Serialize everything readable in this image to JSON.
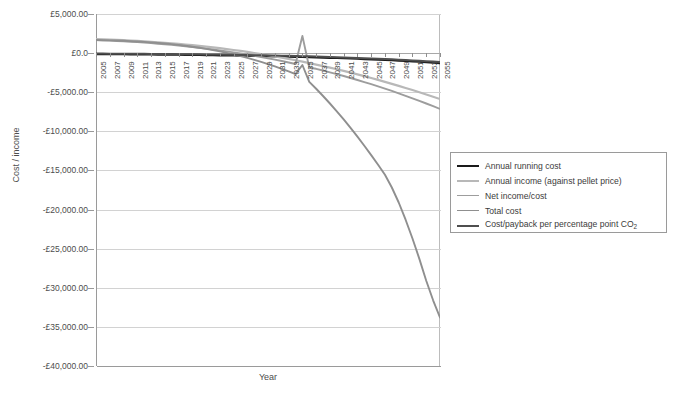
{
  "chart_data": {
    "type": "line",
    "title": "",
    "xlabel": "Year",
    "ylabel": "Cost / income",
    "ylim": [
      -40000,
      5000
    ],
    "ytick_step": 5000,
    "currency_symbol": "£",
    "grid": true,
    "legend_position": "right",
    "ytick_labels": [
      "£5,000.00",
      "£0.0",
      "-£5,000.00",
      "-£10,000.00",
      "-£15,000.00",
      "-£20,000.00",
      "-£25,000.00",
      "-£30,000.00",
      "-£35,000.00",
      "-£40,000.00"
    ],
    "ytick_values": [
      5000,
      0,
      -5000,
      -10000,
      -15000,
      -20000,
      -25000,
      -30000,
      -35000,
      -40000
    ],
    "x": [
      2005,
      2006,
      2007,
      2008,
      2009,
      2010,
      2011,
      2012,
      2013,
      2014,
      2015,
      2016,
      2017,
      2018,
      2019,
      2020,
      2021,
      2022,
      2023,
      2024,
      2025,
      2026,
      2027,
      2028,
      2029,
      2030,
      2031,
      2032,
      2033,
      2034,
      2035,
      2036,
      2037,
      2038,
      2039,
      2040,
      2041,
      2042,
      2043,
      2044,
      2045,
      2046,
      2047,
      2048,
      2049,
      2050,
      2051,
      2052,
      2053,
      2054,
      2055
    ],
    "xtick_labels": [
      "2005",
      "2007",
      "2009",
      "2011",
      "2013",
      "2015",
      "2017",
      "2019",
      "2021",
      "2023",
      "2025",
      "2027",
      "2029",
      "2031",
      "2033",
      "2035",
      "2037",
      "2039",
      "2041",
      "2043",
      "2045",
      "2047",
      "2049",
      "2051",
      "2053",
      "2055"
    ],
    "xlim": [
      2005,
      2055
    ],
    "series": [
      {
        "name": "Annual running cost",
        "color": "#1a1a1a",
        "width": 2.2,
        "values": [
          -120,
          -126,
          -132,
          -138,
          -145,
          -152,
          -159,
          -167,
          -175,
          -183,
          -192,
          -201,
          -211,
          -221,
          -232,
          -243,
          -255,
          -267,
          -280,
          -294,
          -308,
          -323,
          -339,
          -355,
          -372,
          -390,
          -409,
          -429,
          -450,
          -472,
          -495,
          -519,
          -544,
          -570,
          -598,
          -627,
          -657,
          -689,
          -722,
          -757,
          -794,
          -832,
          -872,
          -914,
          -958,
          -1004,
          -1052,
          -1103,
          -1156,
          -1211,
          -1269
        ]
      },
      {
        "name": "Annual income (against pellet price)",
        "color": "#b8b8b8",
        "width": 2.2,
        "values": [
          1790,
          1760,
          1726,
          1690,
          1650,
          1606,
          1558,
          1506,
          1450,
          1389,
          1324,
          1254,
          1180,
          1100,
          1016,
          926,
          832,
          732,
          626,
          515,
          398,
          276,
          148,
          14,
          -126,
          -272,
          -424,
          -582,
          -746,
          -916,
          -1092,
          -1274,
          -1462,
          -1656,
          -1856,
          -2062,
          -2274,
          -2492,
          -2716,
          -2946,
          -3182,
          -3424,
          -3672,
          -3926,
          -4186,
          -4452,
          -4724,
          -5002,
          -5286,
          -5576,
          -5872
        ]
      },
      {
        "name": "Net income/cost",
        "color": "#9d9d9d",
        "width": 1.9,
        "values": [
          1670,
          1634,
          1594,
          1552,
          1505,
          1454,
          1399,
          1339,
          1275,
          1206,
          1132,
          1053,
          969,
          879,
          784,
          683,
          577,
          465,
          346,
          221,
          90,
          -47,
          -191,
          -341,
          -498,
          -662,
          -833,
          -1011,
          -1196,
          -1388,
          2200,
          -1870,
          -2006,
          -2226,
          -2454,
          -2689,
          -2931,
          -3181,
          -3438,
          -3703,
          -3976,
          -4256,
          -4544,
          -4840,
          -5144,
          -5456,
          -5776,
          -6105,
          -6442,
          -6787,
          -7141
        ]
      },
      {
        "name": "Total cost",
        "color": "#8f8f8f",
        "width": 1.9,
        "values": [
          1670,
          1652,
          1630,
          1604,
          1572,
          1534,
          1490,
          1438,
          1378,
          1310,
          1232,
          1144,
          1046,
          938,
          818,
          686,
          542,
          386,
          216,
          32,
          -166,
          -380,
          -610,
          -856,
          -1118,
          -1398,
          -1694,
          -2008,
          -2340,
          -2690,
          -1520,
          -3680,
          -4560,
          -5480,
          -6440,
          -7440,
          -8480,
          -9560,
          -10680,
          -11840,
          -13040,
          -14280,
          -15560,
          -17180,
          -19100,
          -21300,
          -23700,
          -26300,
          -29100,
          -31600,
          -33800
        ]
      },
      {
        "name": "Cost/payback per percentage point CO₂",
        "color": "#4f4f4f",
        "width": 2.0,
        "values": [
          -60,
          -64,
          -68,
          -73,
          -78,
          -83,
          -89,
          -95,
          -101,
          -108,
          -115,
          -123,
          -131,
          -140,
          -149,
          -159,
          -169,
          -180,
          -192,
          -204,
          -217,
          -231,
          -245,
          -260,
          -276,
          -293,
          -311,
          -330,
          -350,
          -371,
          -393,
          -416,
          -440,
          -465,
          -492,
          -520,
          -549,
          -580,
          -612,
          -646,
          -682,
          -719,
          -758,
          -799,
          -842,
          -887,
          -934,
          -983,
          -1034,
          -1088,
          -1144
        ]
      }
    ]
  },
  "legend": {
    "items": [
      {
        "label": "Annual running cost"
      },
      {
        "label": "Annual income (against pellet price)"
      },
      {
        "label": "Net income/cost"
      },
      {
        "label": "Total cost"
      },
      {
        "label": "Cost/payback per percentage point CO"
      }
    ],
    "co2_subscript": "2"
  }
}
